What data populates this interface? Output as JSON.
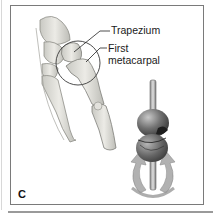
{
  "figure": {
    "panel_letter": "C",
    "labels": [
      {
        "id": "trapezium",
        "text": "Trapezium"
      },
      {
        "id": "first-metacarpal-line1",
        "text": "First"
      },
      {
        "id": "first-metacarpal-line2",
        "text": "metacarpal"
      }
    ],
    "subjects": [
      "hand bones",
      "joint circle highlight",
      "saddle joint model",
      "rotation arrows"
    ]
  }
}
